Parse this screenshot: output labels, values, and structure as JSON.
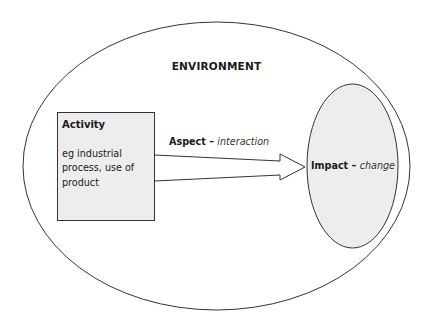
{
  "diagram": {
    "environment": {
      "label": "ENVIRONMENT"
    },
    "activity": {
      "title": "Activity",
      "description": "eg industrial process, use of product"
    },
    "aspect": {
      "label": "Aspect",
      "separator": " – ",
      "qualifier": "interaction"
    },
    "impact": {
      "label": "Impact",
      "separator": " – ",
      "qualifier": "change"
    }
  },
  "colors": {
    "stroke": "#333333",
    "fill": "#ededed",
    "background": "#ffffff"
  }
}
